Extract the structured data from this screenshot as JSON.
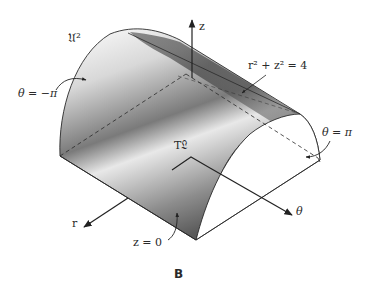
{
  "figure": {
    "caption": "B",
    "labels": {
      "surface_name": "𝔘²",
      "theta_neg": "θ = −π",
      "theta_pos": "θ = π",
      "z_axis": "z",
      "r_axis": "r",
      "theta_axis": "θ",
      "cylinder_eq": "r² + z² = 4",
      "base_eq": "z = 0",
      "tangent_label": "T𝔏"
    },
    "colors": {
      "line": "#2a2a2a",
      "shade_dark": "#3a3a3a",
      "shade_light": "#f2f2f2",
      "background": "#ffffff"
    }
  }
}
